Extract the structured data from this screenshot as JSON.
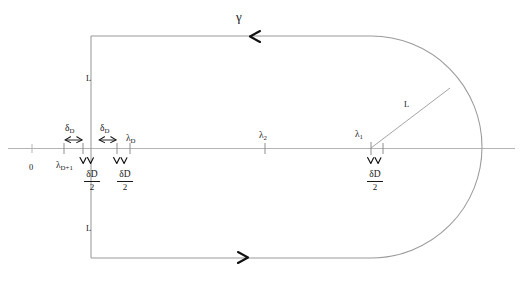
{
  "figure": {
    "title_symbol": "γ",
    "axis_origin_label": "0",
    "colors": {
      "contour": "#9a9a9a",
      "axis": "#b0b0b0",
      "text": "#1a1a1a",
      "arrow": "#111111",
      "background": "#ffffff"
    }
  },
  "labels": {
    "gamma": "γ",
    "origin": "0",
    "height_upper": "L",
    "height_lower": "L",
    "radius": "L",
    "lambda_D_plus_1": {
      "base": "λ",
      "sub": "D+1"
    },
    "lambda_D": {
      "base": "λ",
      "sub": "D"
    },
    "lambda_2": {
      "base": "λ",
      "sub": "2"
    },
    "lambda_1": {
      "base": "λ",
      "sub": "1"
    },
    "delta_left": {
      "base": "δ",
      "sub": "D"
    },
    "delta_right": {
      "base": "δ",
      "sub": "D"
    },
    "half_delta_1": {
      "num_base": "δ",
      "num_sub": "D",
      "den": "2"
    },
    "half_delta_2": {
      "num_base": "δ",
      "num_sub": "D",
      "den": "2"
    },
    "half_delta_3": {
      "num_base": "δ",
      "num_sub": "D",
      "den": "2"
    }
  },
  "geometry": {
    "axis_y": 148,
    "axis_x_start": 8,
    "axis_x_end": 515,
    "origin_tick_x": 32,
    "contour_left_x": 91,
    "contour_top_y": 36,
    "contour_bottom_y": 258,
    "arc_center_x": 371,
    "arc_radius": 111,
    "tick_lambda_D_plus_1_x": 64,
    "tick_mid_left_x": 83,
    "tick_lambda_D_x": 117,
    "tick_lambda_D_right_x": 130,
    "tick_lambda_2_x": 265,
    "tick_lambda_1_x": 371,
    "tick_lambda_1_right_x": 383
  }
}
